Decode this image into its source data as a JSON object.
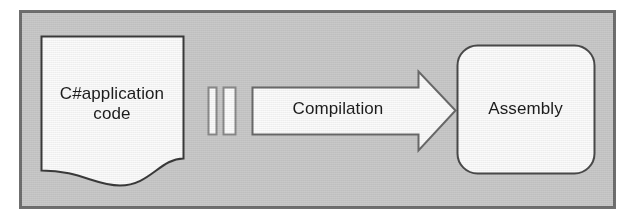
{
  "diagram": {
    "type": "flow-diagram",
    "frame": {
      "background_color": "#c9c9c9",
      "border_color": "#6f6f6f"
    },
    "nodes": [
      {
        "id": "source-document",
        "shape": "document",
        "label": "C#application\ncode",
        "fill_color": "#fbfbfb",
        "border_color": "#3a3a3a"
      },
      {
        "id": "process-arrow",
        "shape": "block-arrow-right",
        "label": "Compilation",
        "fill_color": "#fbfbfb",
        "border_color": "#6a6a6a"
      },
      {
        "id": "assembly-box",
        "shape": "rounded-rectangle",
        "label": "Assembly",
        "fill_color": "#fbfbfb",
        "border_color": "#4a4a4a"
      }
    ],
    "decorations": [
      {
        "id": "tick-bar-1",
        "shape": "vertical-bar",
        "fill_color": "#fbfbfb",
        "border_color": "#8a8a8a"
      },
      {
        "id": "tick-bar-2",
        "shape": "vertical-bar",
        "fill_color": "#fbfbfb",
        "border_color": "#8a8a8a"
      }
    ]
  },
  "labels": {
    "document_line1": "C#application",
    "document_line2": "code",
    "arrow": "Compilation",
    "assembly": "Assembly"
  }
}
